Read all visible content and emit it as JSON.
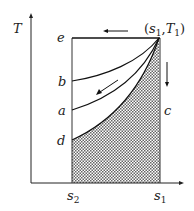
{
  "diagram": {
    "axis_y_label": "T",
    "point_label": {
      "open": "(",
      "s": "s",
      "s_sub": "1",
      "comma": ",",
      "t": "T",
      "t_sub": "1",
      "close": ")"
    },
    "left_labels": {
      "e": "e",
      "b": "b",
      "a": "a",
      "d": "d"
    },
    "right_label": "c",
    "x_ticks": [
      {
        "base": "s",
        "sub": "2"
      },
      {
        "base": "s",
        "sub": "1"
      }
    ],
    "colors": {
      "line": "#1a1a1a",
      "hatch": "#555555",
      "background": "#ffffff"
    }
  }
}
